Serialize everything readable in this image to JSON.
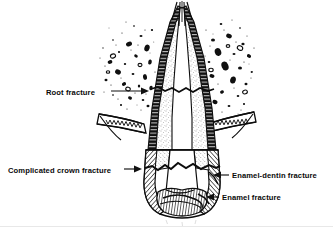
{
  "figure": {
    "background_color": "#ffffff",
    "ink_color": "#111111",
    "width": 333,
    "height": 227
  },
  "labels": [
    {
      "id": "root-fracture",
      "text": "Root fracture",
      "text_x": 46,
      "text_y": 95,
      "anchor": "start",
      "leader": "M 111 91 L 147 91",
      "arrow_x": 147,
      "arrow_y": 91,
      "arrow_dir": "right"
    },
    {
      "id": "complicated-crown-fracture",
      "text": "Complicated crown fracture",
      "text_x": 8,
      "text_y": 173,
      "anchor": "start",
      "leader": "M 123 169 L 140 169",
      "arrow_x": 141,
      "arrow_y": 169,
      "arrow_dir": "right"
    },
    {
      "id": "enamel-dentin-fracture",
      "text": "Enamel-dentin fracture",
      "text_x": 232,
      "text_y": 178,
      "anchor": "start",
      "leader": "M 228 175 L 214 175",
      "arrow_x": 212,
      "arrow_y": 175,
      "arrow_dir": "left"
    },
    {
      "id": "enamel-fracture",
      "text": "Enamel fracture",
      "text_x": 222,
      "text_y": 200,
      "anchor": "start",
      "leader": "M 219 197 L 207 197",
      "arrow_x": 205,
      "arrow_y": 197,
      "arrow_dir": "left"
    }
  ],
  "anatomy": {
    "parts": [
      "alveolar-bone-left",
      "alveolar-bone-right",
      "gingiva-left",
      "gingiva-right",
      "tooth-root",
      "pulp-canal",
      "dentin",
      "enamel-crown",
      "root-fracture-line",
      "crown-fracture-line"
    ]
  }
}
